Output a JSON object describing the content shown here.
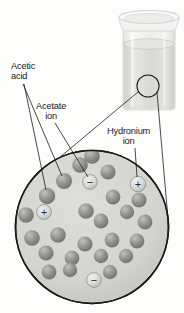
{
  "figure": {
    "width": 184,
    "height": 313
  },
  "labels": {
    "acetic_acid": "Acetic\nacid",
    "acetate_ion": "Acetate\nion",
    "hydronium_ion": "Hydronium\nion"
  },
  "ion_symbols": {
    "positive": "+",
    "negative": "−"
  },
  "colors": {
    "molecule_fill": "#8f8f8f",
    "molecule_highlight": "#bdbdbd",
    "molecule_shadow": "#6e6e6e",
    "ion_fill": "#d7d7d4",
    "ion_stroke": "#6b6b6b",
    "solution_fill": "#d5d5d2",
    "circle_stroke": "#1a1a1a",
    "beaker_glass": "#ececeb",
    "beaker_liquid": "#d8d8d6",
    "label_text": "#1a1a1a",
    "leader_line": "#1a1a1a",
    "background": "#fdfdfc"
  },
  "beaker": {
    "name": "beaker of acetic acid solution",
    "callout_circle": {
      "cx": 148,
      "cy": 86,
      "r": 11
    }
  },
  "magnified_view": {
    "circle": {
      "cx": 92,
      "cy": 227,
      "r": 77
    },
    "description": "Magnified view of the acetic acid solution"
  },
  "particles": {
    "acetic_acid_molecules": [
      {
        "cx": 64,
        "cy": 181,
        "r": 8.0
      },
      {
        "cx": 47,
        "cy": 196,
        "r": 8.2
      },
      {
        "cx": 80,
        "cy": 165,
        "r": 7.8
      },
      {
        "cx": 108,
        "cy": 172,
        "r": 7.6
      },
      {
        "cx": 113,
        "cy": 197,
        "r": 7.4
      },
      {
        "cx": 139,
        "cy": 200,
        "r": 7.6
      },
      {
        "cx": 127,
        "cy": 212,
        "r": 7.2
      },
      {
        "cx": 145,
        "cy": 222,
        "r": 7.4
      },
      {
        "cx": 86,
        "cy": 211,
        "r": 7.8
      },
      {
        "cx": 101,
        "cy": 221,
        "r": 7.4
      },
      {
        "cx": 26,
        "cy": 215,
        "r": 7.8
      },
      {
        "cx": 32,
        "cy": 238,
        "r": 7.8
      },
      {
        "cx": 58,
        "cy": 235,
        "r": 7.8
      },
      {
        "cx": 85,
        "cy": 244,
        "r": 7.6
      },
      {
        "cx": 112,
        "cy": 240,
        "r": 7.4
      },
      {
        "cx": 137,
        "cy": 241,
        "r": 7.4
      },
      {
        "cx": 46,
        "cy": 253,
        "r": 7.6
      },
      {
        "cx": 72,
        "cy": 258,
        "r": 7.4
      },
      {
        "cx": 101,
        "cy": 256,
        "r": 7.2
      },
      {
        "cx": 126,
        "cy": 256,
        "r": 7.2
      },
      {
        "cx": 49,
        "cy": 272,
        "r": 7.4
      },
      {
        "cx": 70,
        "cy": 270,
        "r": 7.2
      },
      {
        "cx": 110,
        "cy": 272,
        "r": 7.2
      },
      {
        "cx": 92,
        "cy": 156,
        "r": 7.8
      }
    ],
    "hydronium_ions": [
      {
        "cx": 44,
        "cy": 212,
        "r": 7.4,
        "charge": "+"
      },
      {
        "cx": 138,
        "cy": 184,
        "r": 7.8,
        "charge": "+"
      }
    ],
    "acetate_ions": [
      {
        "cx": 90,
        "cy": 182,
        "r": 7.4,
        "charge": "−"
      },
      {
        "cx": 94,
        "cy": 280,
        "r": 7.4,
        "charge": "−"
      }
    ]
  },
  "leader_lines": {
    "acetic_acid": [
      {
        "from_x": 23,
        "from_y": 83,
        "to_x": 62,
        "to_y": 178
      },
      {
        "from_x": 23,
        "from_y": 83,
        "to_x": 45,
        "to_y": 193
      }
    ],
    "acetate_ion": [
      {
        "from_x": 52,
        "from_y": 122,
        "to_x": 88,
        "to_y": 179
      }
    ],
    "hydronium_ion": [
      {
        "from_x": 135,
        "from_y": 148,
        "to_x": 137,
        "to_y": 177
      }
    ],
    "beaker_to_magnifier": [
      {
        "from_x": 138,
        "from_y": 90,
        "to_x": 30,
        "to_y": 180
      },
      {
        "from_x": 157,
        "from_y": 92,
        "to_x": 168,
        "to_y": 218
      }
    ]
  }
}
